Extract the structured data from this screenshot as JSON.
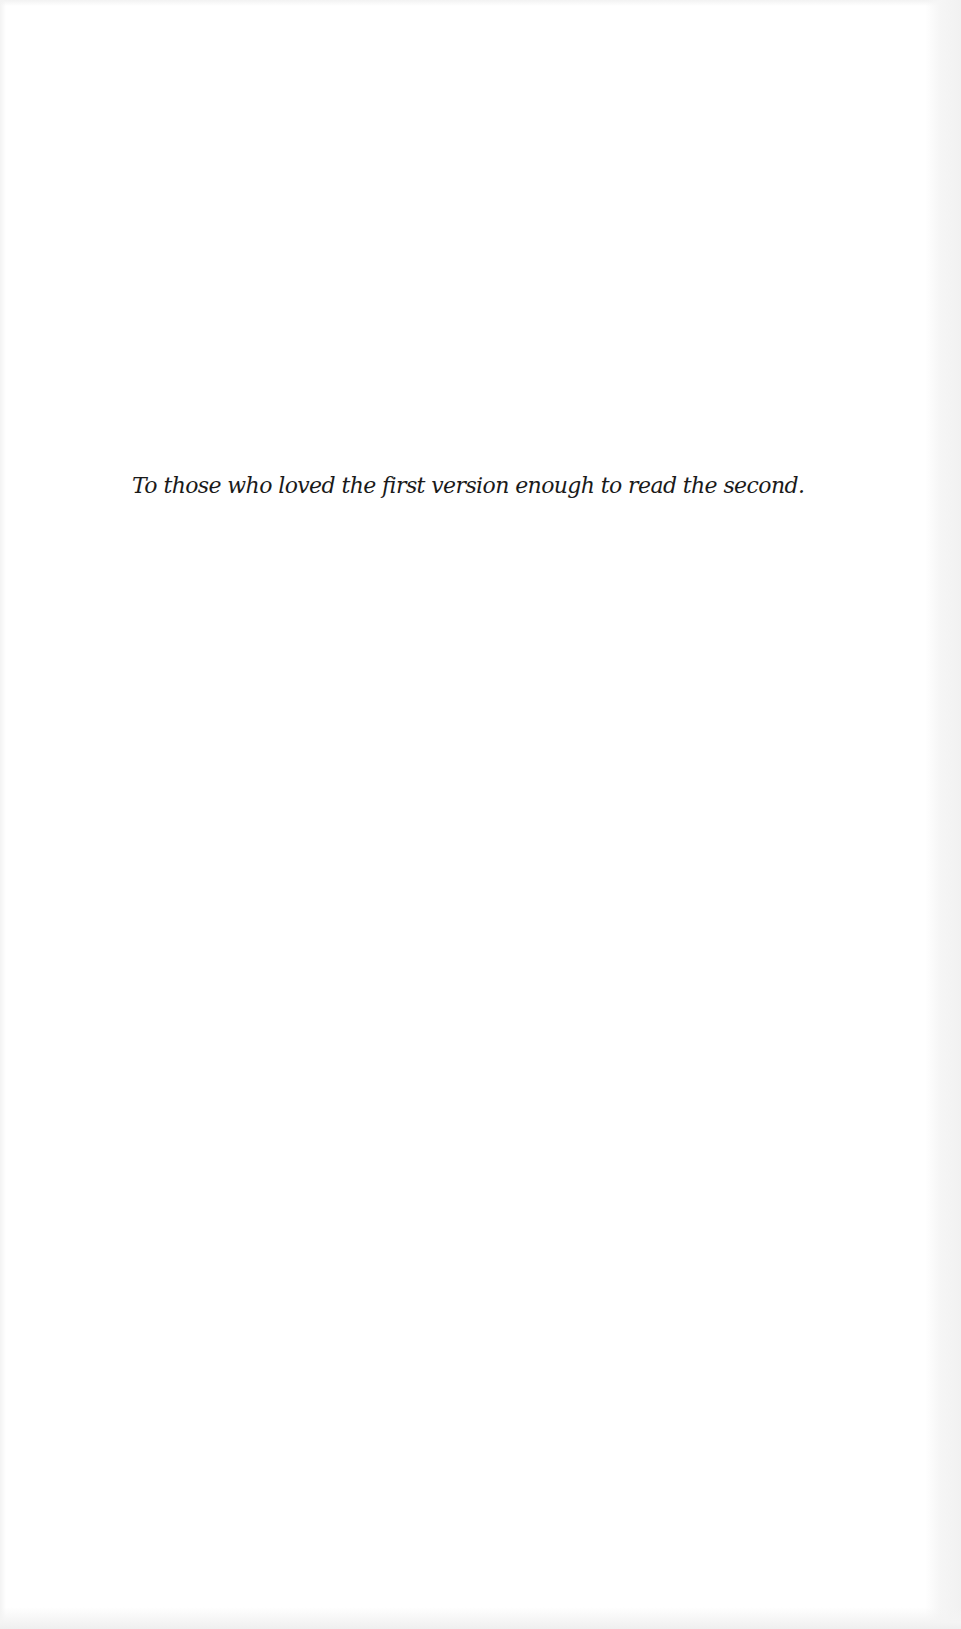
{
  "page": {
    "type": "dedication",
    "background_color": "#ffffff",
    "text_color": "#1a1a1a"
  },
  "dedication": {
    "text": "To those who loved the first version enough to read the second."
  }
}
